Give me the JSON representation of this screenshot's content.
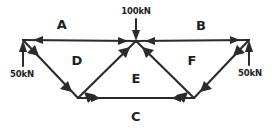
{
  "figure": {
    "ink_color": "#2b2b2b",
    "background_color": "#ffffff"
  },
  "members": [
    {
      "id": "A",
      "label": "A",
      "label_x": 62,
      "label_y": 24,
      "position": "top-left-chord"
    },
    {
      "id": "B",
      "label": "B",
      "label_x": 201,
      "label_y": 25,
      "position": "top-right-chord"
    },
    {
      "id": "C",
      "label": "C",
      "label_x": 136,
      "label_y": 116,
      "position": "bottom-chord"
    },
    {
      "id": "D",
      "label": "D",
      "label_x": 77,
      "label_y": 60,
      "position": "left-diagonal"
    },
    {
      "id": "E",
      "label": "E",
      "label_x": 136,
      "label_y": 78,
      "position": "center-diagonals"
    },
    {
      "id": "F",
      "label": "F",
      "label_x": 192,
      "label_y": 60,
      "position": "right-diagonal"
    }
  ],
  "forces": [
    {
      "id": "apex-load",
      "label": "100kN",
      "label_x": 136,
      "label_y": 11,
      "direction": "down",
      "location": "apex"
    },
    {
      "id": "left-support",
      "label": "50kN",
      "label_x": 22,
      "label_y": 74,
      "direction": "up",
      "location": "left-support"
    },
    {
      "id": "right-support",
      "label": "50kN",
      "label_x": 250,
      "label_y": 73,
      "direction": "up",
      "location": "right-support"
    }
  ],
  "nodes": [
    {
      "id": "left-node",
      "x": 23,
      "y": 40
    },
    {
      "id": "apex-node",
      "x": 136,
      "y": 41
    },
    {
      "id": "right-node",
      "x": 249,
      "y": 40
    },
    {
      "id": "bottom-left-node",
      "x": 78,
      "y": 98
    },
    {
      "id": "bottom-right-node",
      "x": 194,
      "y": 98
    }
  ]
}
